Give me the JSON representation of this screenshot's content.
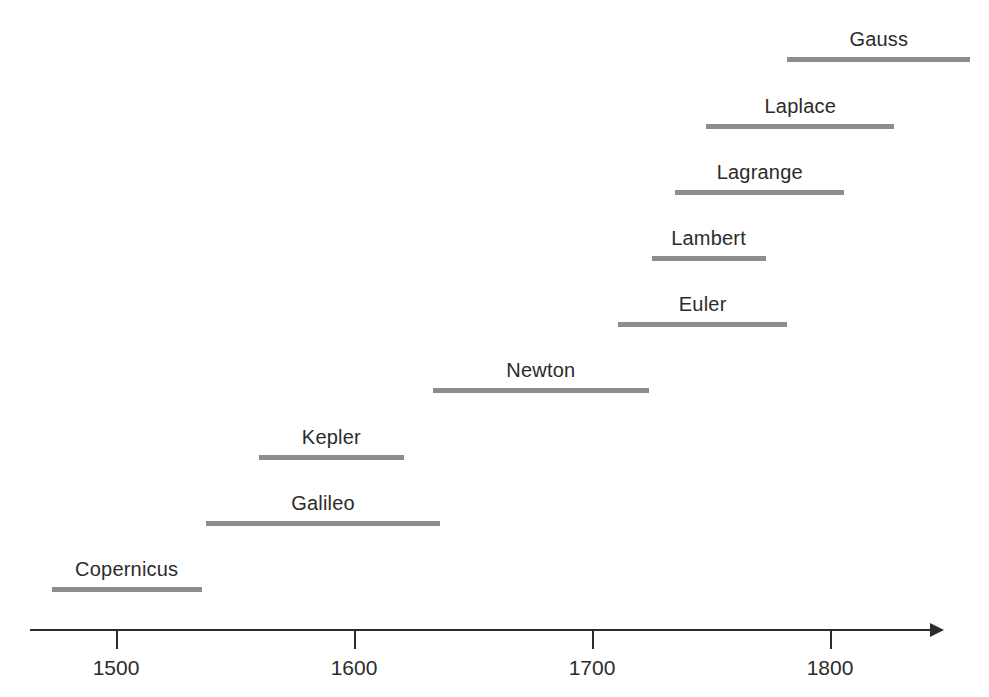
{
  "chart_data": {
    "type": "bar",
    "orientation": "horizontal",
    "title": "",
    "subtitle": "",
    "xlabel": "",
    "ylabel": "",
    "xlim": [
      1470,
      1850
    ],
    "xticks": [
      1500,
      1600,
      1700,
      1800
    ],
    "xtick_labels": [
      "1500",
      "1600",
      "1700",
      "1800"
    ],
    "grid": false,
    "legend": null,
    "bar_color": "#8d8d8d",
    "axis_color": "#2b2b2b",
    "background_color": "#ffffff",
    "categories": [
      "Copernicus",
      "Galileo",
      "Kepler",
      "Newton",
      "Euler",
      "Lambert",
      "Lagrange",
      "Laplace",
      "Gauss"
    ],
    "bars": [
      {
        "label": "Copernicus",
        "start": 1473,
        "end": 1536,
        "row": 0
      },
      {
        "label": "Galileo",
        "start": 1538,
        "end": 1636,
        "row": 1
      },
      {
        "label": "Kepler",
        "start": 1560,
        "end": 1621,
        "row": 2
      },
      {
        "label": "Newton",
        "start": 1633,
        "end": 1724,
        "row": 3
      },
      {
        "label": "Euler",
        "start": 1711,
        "end": 1782,
        "row": 4
      },
      {
        "label": "Lambert",
        "start": 1725,
        "end": 1773,
        "row": 5
      },
      {
        "label": "Lagrange",
        "start": 1735,
        "end": 1806,
        "row": 6
      },
      {
        "label": "Laplace",
        "start": 1748,
        "end": 1827,
        "row": 7
      },
      {
        "label": "Gauss",
        "start": 1782,
        "end": 1859,
        "row": 8
      }
    ]
  },
  "axis": {
    "ticks": [
      {
        "value": 1500,
        "label": "1500"
      },
      {
        "value": 1600,
        "label": "1600"
      },
      {
        "value": 1700,
        "label": "1700"
      },
      {
        "value": 1800,
        "label": "1800"
      }
    ]
  }
}
